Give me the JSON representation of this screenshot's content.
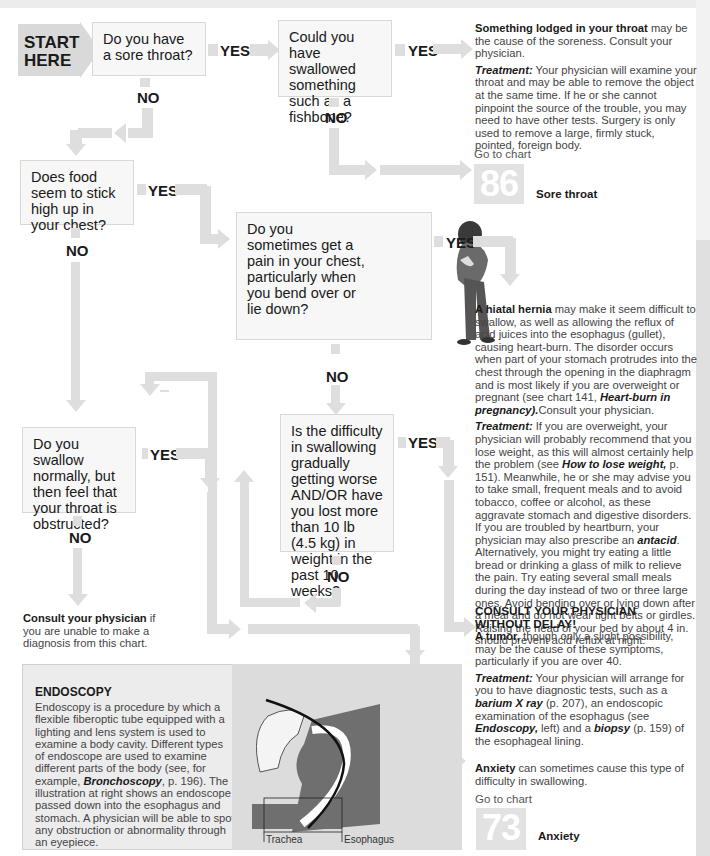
{
  "start": {
    "label_line1": "START",
    "label_line2": "HERE"
  },
  "questions": {
    "q1": "Do you have a sore throat?",
    "q2": "Could you have swallowed something such as a fishbone?",
    "q3": "Does food seem to stick high up in your chest?",
    "q4": "Do you sometimes get a pain in your chest, particularly when you bend over or lie down?",
    "q5": "Is the difficulty in swallowing gradually getting worse AND/OR have you lost more than 10 lb (4.5 kg) in weight in the past 10 weeks?",
    "q6": "Do you swallow normally, but then feel that your throat is obstructed?"
  },
  "labels": {
    "yes": "YES",
    "no": "NO"
  },
  "outcomes": {
    "lodged": {
      "bold": "Something lodged in your throat",
      "text": " may be the cause of the soreness. Consult your physician.",
      "treatment_label": "Treatment:",
      "treatment": " Your physician will examine your throat and may be able to remove the object at the same time. If he or she cannot pinpoint the source of the trouble, you may need to have other tests. Surgery is only used to remove a large, firmly stuck, pointed, foreign body."
    },
    "sore_throat": {
      "goto": "Go to chart",
      "number": "86",
      "name": "Sore throat"
    },
    "hernia": {
      "bold": "A hiatal hernia",
      "text": " may make it seem difficult to swallow, as well as allowing the reflux of acid juices into the esophagus (gullet), causing heart-burn. The disorder occurs when part of your stomach protrudes into the chest through the opening in the diaphragm and is most likely if you are overweight or pregnant (see chart 141, ",
      "ref": "Heart-burn in pregnancy).",
      "text2": "Consult your physician.",
      "treatment_label": "Treatment:",
      "treatment1": " If you are overweight, your physician will probably recommend that you lose weight, as this will almost certainly help the problem (see ",
      "treatment_ref": "How to lose weight,",
      "treatment2": " p. 151). Meanwhile, he or she may advise you to take small, frequent meals and to avoid tobacco, coffee or alcohol, as these aggravate stomach and digestive disorders. If you are troubled by heartburn, your physician may also prescribe an ",
      "treatment_ref2": "antacid",
      "treatment3": ". Alternatively, you might try eating a little bread or drinking a glass of milk to relieve the pain. Try eating several small meals during the day instead of two or three large ones. Avoid bending over or lying down after a meal and do not wear tight belts or girdles. Raising the head of your bed by about 4 in. should prevent acid reflux at night."
    },
    "tumor": {
      "heading1": "CONSULT YOUR PHYSICIAN",
      "heading2": "WITHOUT DELAY!",
      "bold": "A tumor,",
      "text": " though only a slight possibility, may be the cause of these symptoms, particularly if you are over 40.",
      "treatment_label": "Treatment:",
      "treatment1": " Your physician will arrange for you to have diagnostic tests, such as a ",
      "ref1": "barium X ray",
      "treatment2": " (p. 207), an endoscopic examination of the esophagus (see ",
      "ref2": "Endoscopy,",
      "treatment3": " left) and a ",
      "ref3": "biopsy",
      "treatment4": " (p. 159) of the esophageal lining."
    },
    "anxiety": {
      "bold": "Anxiety",
      "text": " can sometimes cause this type of difficulty in swallowing.",
      "goto": "Go to chart",
      "number": "73",
      "name": "Anxiety"
    },
    "consult": {
      "bold": "Consult your physician",
      "text": " if you are unable to make a diagnosis from this chart."
    }
  },
  "endoscopy": {
    "title": "ENDOSCOPY",
    "text1": "Endoscopy is a procedure by which a flexible fiberoptic tube equipped with a lighting and lens system is used to examine a body cavity. Different types of endoscope are used to examine different parts of the body (see, for example, ",
    "ref": "Bronchoscopy",
    "text2": ", p. 196). The illustration at right shows an endoscope passed down into the esophagus and stomach. A physician will be able to spot any obstruction or abnormality through an eyepiece.",
    "label_trachea": "Trachea",
    "label_esophagus": "Esophagus"
  }
}
